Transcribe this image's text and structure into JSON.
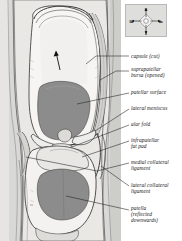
{
  "figure": {
    "type": "anatomical-illustration",
    "view": "anterior, joint capsule cut and opened"
  },
  "compass": {
    "name": "orientation-indicator",
    "superior": "S",
    "inferior": "I",
    "lateral": "la",
    "medial": "m"
  },
  "labels": [
    {
      "id": "capsule-cut",
      "text": "capsule (cut)",
      "x": 131,
      "y": 57,
      "lines": 1
    },
    {
      "id": "suprapatellar-bursa",
      "text": "suprapatellar\nbursa (opened)",
      "x": 131,
      "y": 70,
      "lines": 2
    },
    {
      "id": "patellar-surface",
      "text": "patellar surface",
      "x": 131,
      "y": 93,
      "lines": 1
    },
    {
      "id": "lateral-meniscus",
      "text": "lateral meniscus",
      "x": 131,
      "y": 109,
      "lines": 1
    },
    {
      "id": "alar-fold",
      "text": "alar fold",
      "x": 131,
      "y": 125,
      "lines": 1
    },
    {
      "id": "infrapatellar-fat-pad",
      "text": "infrapatellar\nfat pad",
      "x": 131,
      "y": 140,
      "lines": 2
    },
    {
      "id": "medial-collateral-ligament",
      "text": "medial collateral\nligament",
      "x": 131,
      "y": 162,
      "lines": 2
    },
    {
      "id": "lateral-collateral-ligament",
      "text": "lateral collateral\nligament",
      "x": 131,
      "y": 185,
      "lines": 2
    },
    {
      "id": "patella-reflected",
      "text": "patella\n(reflected\ndownwards)",
      "x": 131,
      "y": 208,
      "lines": 3
    }
  ],
  "colors": {
    "panel_background": "#d8d8d6",
    "bone_light": "#f4f3f1",
    "cartilage_dark": "#8f8f8f",
    "soft_tissue": "#c9c8c5",
    "outline": "#2b2b2b",
    "label_text": "#1a1a1a",
    "compass_bg": "#dededc"
  }
}
